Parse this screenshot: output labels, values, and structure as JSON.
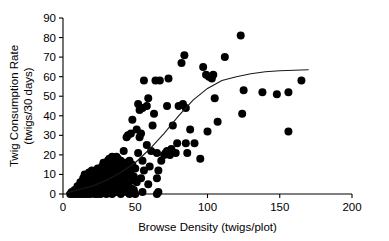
{
  "chart_data": {
    "type": "scatter",
    "title": "",
    "xlabel": "Browse Density (twigs/plot)",
    "ylabel_line1": "Twig Consumption Rate",
    "ylabel_line2": "(twigs/30 days)",
    "xlim": [
      0,
      200
    ],
    "ylim": [
      0,
      90
    ],
    "xticks": [
      0,
      50,
      100,
      150,
      200
    ],
    "yticks": [
      0,
      10,
      20,
      30,
      40,
      50,
      60,
      70,
      80,
      90
    ],
    "xtick_labels": [
      "0",
      "50",
      "100",
      "150",
      "200"
    ],
    "ytick_labels": [
      "0",
      "10",
      "20",
      "30",
      "40",
      "50",
      "60",
      "70",
      "80",
      "90"
    ],
    "grid": false,
    "legend": false,
    "marker": "filled-circle",
    "marker_color": "#000000",
    "marker_size_px": 5.2,
    "series": [
      {
        "name": "Observations",
        "points": [
          [
            5,
            0
          ],
          [
            6,
            1
          ],
          [
            7,
            0
          ],
          [
            8,
            2
          ],
          [
            9,
            0
          ],
          [
            10,
            1
          ],
          [
            10,
            4
          ],
          [
            11,
            0
          ],
          [
            11,
            3
          ],
          [
            12,
            1
          ],
          [
            12,
            6
          ],
          [
            13,
            0
          ],
          [
            13,
            2
          ],
          [
            13,
            5
          ],
          [
            14,
            1
          ],
          [
            14,
            8
          ],
          [
            15,
            0
          ],
          [
            15,
            3
          ],
          [
            15,
            10
          ],
          [
            16,
            1
          ],
          [
            16,
            6
          ],
          [
            17,
            0
          ],
          [
            17,
            2
          ],
          [
            17,
            9
          ],
          [
            18,
            4
          ],
          [
            18,
            11
          ],
          [
            19,
            0
          ],
          [
            19,
            7
          ],
          [
            20,
            1
          ],
          [
            20,
            10
          ],
          [
            20,
            12
          ],
          [
            21,
            3
          ],
          [
            21,
            8
          ],
          [
            22,
            0
          ],
          [
            22,
            5
          ],
          [
            22,
            11
          ],
          [
            23,
            1
          ],
          [
            23,
            9
          ],
          [
            24,
            0
          ],
          [
            24,
            13
          ],
          [
            25,
            2
          ],
          [
            25,
            7
          ],
          [
            25,
            12
          ],
          [
            26,
            0
          ],
          [
            26,
            10
          ],
          [
            27,
            5
          ],
          [
            27,
            14
          ],
          [
            28,
            1
          ],
          [
            28,
            9
          ],
          [
            28,
            16
          ],
          [
            29,
            3
          ],
          [
            29,
            12
          ],
          [
            30,
            0
          ],
          [
            30,
            8
          ],
          [
            30,
            15
          ],
          [
            31,
            5
          ],
          [
            31,
            17
          ],
          [
            32,
            2
          ],
          [
            32,
            11
          ],
          [
            32,
            18
          ],
          [
            33,
            6
          ],
          [
            33,
            14
          ],
          [
            34,
            0
          ],
          [
            34,
            9
          ],
          [
            34,
            19
          ],
          [
            35,
            3
          ],
          [
            35,
            13
          ],
          [
            35,
            17
          ],
          [
            36,
            7
          ],
          [
            36,
            16
          ],
          [
            37,
            1
          ],
          [
            37,
            11
          ],
          [
            37,
            19
          ],
          [
            38,
            5
          ],
          [
            38,
            14
          ],
          [
            38,
            18
          ],
          [
            39,
            2
          ],
          [
            39,
            9
          ],
          [
            39,
            16
          ],
          [
            40,
            0
          ],
          [
            40,
            12
          ],
          [
            40,
            17
          ],
          [
            41,
            6
          ],
          [
            41,
            15
          ],
          [
            42,
            3
          ],
          [
            42,
            11
          ],
          [
            42,
            22
          ],
          [
            43,
            8
          ],
          [
            43,
            16
          ],
          [
            44,
            1
          ],
          [
            44,
            13
          ],
          [
            44,
            29
          ],
          [
            45,
            5
          ],
          [
            45,
            14
          ],
          [
            45,
            30
          ],
          [
            46,
            0
          ],
          [
            46,
            10
          ],
          [
            46,
            17
          ],
          [
            47,
            3
          ],
          [
            47,
            12
          ],
          [
            47,
            31
          ],
          [
            48,
            7
          ],
          [
            48,
            15
          ],
          [
            48,
            38
          ],
          [
            49,
            2
          ],
          [
            49,
            9
          ],
          [
            50,
            0
          ],
          [
            50,
            13
          ],
          [
            51,
            6
          ],
          [
            51,
            33
          ],
          [
            52,
            21
          ],
          [
            52,
            46
          ],
          [
            53,
            29
          ],
          [
            53,
            43
          ],
          [
            54,
            8
          ],
          [
            54,
            31
          ],
          [
            55,
            1
          ],
          [
            55,
            17
          ],
          [
            55,
            44
          ],
          [
            56,
            12
          ],
          [
            56,
            58
          ],
          [
            58,
            25
          ],
          [
            58,
            45
          ],
          [
            59,
            5
          ],
          [
            59,
            49
          ],
          [
            60,
            14
          ],
          [
            61,
            22
          ],
          [
            62,
            35
          ],
          [
            63,
            41
          ],
          [
            64,
            58
          ],
          [
            65,
            0
          ],
          [
            65,
            8
          ],
          [
            65,
            21
          ],
          [
            66,
            1
          ],
          [
            66,
            12
          ],
          [
            67,
            58
          ],
          [
            68,
            17
          ],
          [
            70,
            20
          ],
          [
            71,
            21
          ],
          [
            72,
            22
          ],
          [
            72,
            45
          ],
          [
            73,
            21
          ],
          [
            73,
            59
          ],
          [
            74,
            20
          ],
          [
            75,
            23
          ],
          [
            76,
            35
          ],
          [
            78,
            21
          ],
          [
            79,
            26
          ],
          [
            80,
            45
          ],
          [
            82,
            67
          ],
          [
            83,
            46
          ],
          [
            84,
            71
          ],
          [
            85,
            26
          ],
          [
            85,
            44
          ],
          [
            86,
            21
          ],
          [
            88,
            33
          ],
          [
            91,
            26
          ],
          [
            95,
            18
          ],
          [
            97,
            65
          ],
          [
            99,
            61
          ],
          [
            100,
            32
          ],
          [
            101,
            60
          ],
          [
            103,
            59
          ],
          [
            104,
            61
          ],
          [
            105,
            49
          ],
          [
            107,
            37
          ],
          [
            112,
            70
          ],
          [
            123,
            81
          ],
          [
            124,
            41
          ],
          [
            125,
            53
          ],
          [
            138,
            52
          ],
          [
            148,
            51
          ],
          [
            156,
            32
          ],
          [
            156,
            52
          ],
          [
            165,
            58
          ]
        ]
      }
    ],
    "fit_curve": {
      "name": "Sigmoid fit",
      "color": "#1a1a1a",
      "points": [
        [
          2,
          0.5
        ],
        [
          10,
          2
        ],
        [
          20,
          4
        ],
        [
          30,
          7
        ],
        [
          40,
          11
        ],
        [
          50,
          16
        ],
        [
          60,
          23
        ],
        [
          70,
          31
        ],
        [
          80,
          40
        ],
        [
          90,
          48
        ],
        [
          100,
          54
        ],
        [
          110,
          58
        ],
        [
          120,
          60
        ],
        [
          130,
          61.5
        ],
        [
          140,
          62.5
        ],
        [
          150,
          63
        ],
        [
          160,
          63.3
        ],
        [
          170,
          63.5
        ]
      ]
    }
  }
}
